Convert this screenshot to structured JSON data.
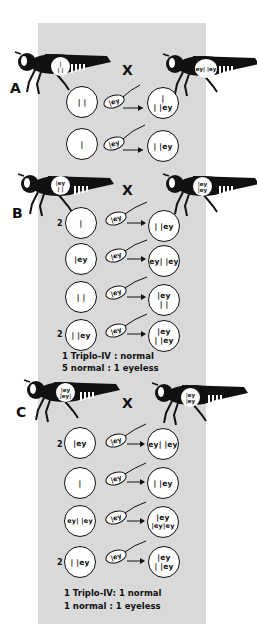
{
  "colors": {
    "panel": "#d9d9d9",
    "ink": "#111111",
    "paper": "#ffffff"
  },
  "cross_symbol": "X",
  "sections": [
    {
      "label": "A",
      "female_karyotype": [
        "|",
        "| |"
      ],
      "male_karyotype": [
        "ey| |ey"
      ],
      "rows": [
        {
          "count": "",
          "egg": "| |",
          "sperm": "|ey",
          "zygote": [
            "|",
            "| |ey"
          ]
        },
        {
          "count": "",
          "egg": "|",
          "sperm": "|ey",
          "zygote": [
            "| |ey"
          ]
        }
      ],
      "ratios": []
    },
    {
      "label": "B",
      "female_karyotype": [
        "|ey",
        "| |"
      ],
      "male_karyotype": [
        "|ey",
        "|ey"
      ],
      "rows": [
        {
          "count": "2",
          "egg": "|",
          "sperm": "|ey",
          "zygote": [
            "| |ey"
          ]
        },
        {
          "count": "",
          "egg": "|ey",
          "sperm": "|ey",
          "zygote": [
            "ey| |ey"
          ]
        },
        {
          "count": "",
          "egg": "| |",
          "sperm": "|ey",
          "zygote": [
            "|ey",
            "| |"
          ]
        },
        {
          "count": "2",
          "egg": "| |ey",
          "sperm": "|ey",
          "zygote": [
            "|ey",
            "| |ey"
          ]
        }
      ],
      "ratios": [
        "1 Triplo-IV : normal",
        "5 normal : 1 eyeless"
      ]
    },
    {
      "label": "C",
      "female_karyotype": [
        "|ey",
        "|ey|"
      ],
      "male_karyotype": [
        "|ey",
        "|ey"
      ],
      "rows": [
        {
          "count": "2",
          "egg": "|ey",
          "sperm": "|ey",
          "zygote": [
            "ey| |ey"
          ]
        },
        {
          "count": "",
          "egg": "|",
          "sperm": "|ey",
          "zygote": [
            "| |ey"
          ]
        },
        {
          "count": "",
          "egg": "ey| |ey",
          "sperm": "|ey",
          "zygote": [
            "|ey",
            "|ey|ey"
          ]
        },
        {
          "count": "2",
          "egg": "| |ey",
          "sperm": "|ey",
          "zygote": [
            "|ey",
            "| |ey"
          ]
        }
      ],
      "ratios": [
        "1 Triplo-IV: 1 normal",
        "1 normal : 1 eyeless"
      ]
    }
  ]
}
